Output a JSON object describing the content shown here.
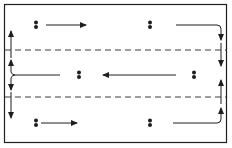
{
  "diagram": {
    "type": "flow-pattern",
    "colors": {
      "ink": "#1e1e1e",
      "background": "#ffffff",
      "dash": "#3a3a3a"
    },
    "frame": {
      "x": 4,
      "y": 4,
      "width": 223,
      "height": 139
    },
    "dashed_lines_y": [
      50,
      97
    ],
    "lanes": [
      {
        "name": "top",
        "direction": "right",
        "dots_x": [
          36,
          150
        ],
        "y": 25
      },
      {
        "name": "middle",
        "direction": "left",
        "dots_x": [
          79,
          194
        ],
        "y": 75
      },
      {
        "name": "bottom",
        "direction": "right",
        "dots_x": [
          36,
          150
        ],
        "y": 123
      }
    ]
  }
}
